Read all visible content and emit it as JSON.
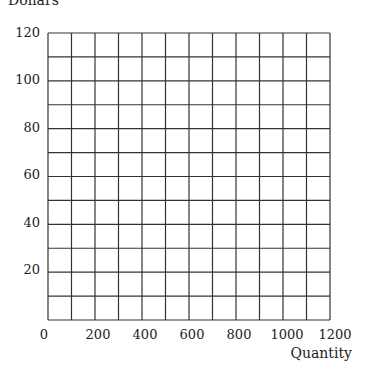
{
  "chart_data": {
    "type": "line",
    "title": "",
    "xlabel": "Quantity",
    "ylabel": "Dollars",
    "xlim": [
      0,
      1200
    ],
    "ylim": [
      0,
      120
    ],
    "x_ticks": [
      "0",
      "200",
      "400",
      "600",
      "800",
      "1000",
      "1200"
    ],
    "y_ticks": [
      "20",
      "40",
      "60",
      "80",
      "100",
      "120"
    ],
    "grid": true,
    "grid_x_step": 100,
    "grid_y_step": 10,
    "series": []
  },
  "labels": {
    "ylabel": "Dollars",
    "xlabel": "Quantity",
    "yt0": "120",
    "yt1": "100",
    "yt2": "80",
    "yt3": "60",
    "yt4": "40",
    "yt5": "20",
    "xt0": "0",
    "xt1": "200",
    "xt2": "400",
    "xt3": "600",
    "xt4": "800",
    "xt5": "1000",
    "xt6": "1200"
  }
}
